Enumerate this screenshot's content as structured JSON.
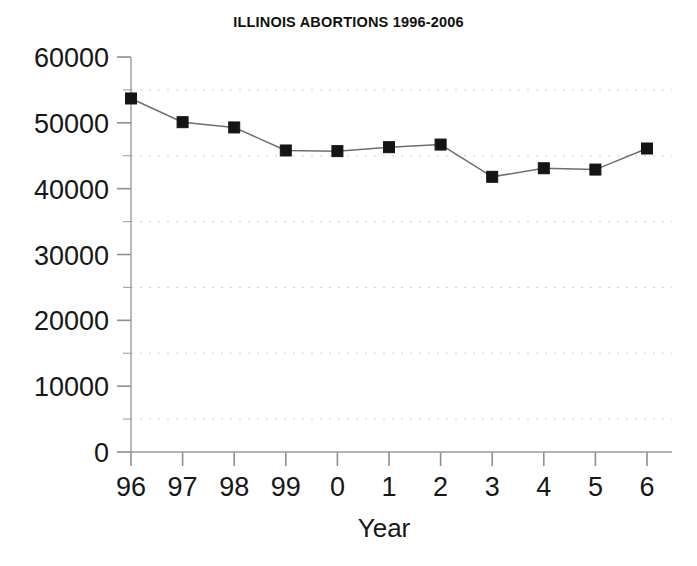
{
  "chart_data": {
    "type": "line",
    "title": "ILLINOIS ABORTIONS 1996-2006",
    "xlabel": "Year",
    "ylabel": "",
    "categories": [
      "96",
      "97",
      "98",
      "99",
      "0",
      "1",
      "2",
      "3",
      "4",
      "5",
      "6"
    ],
    "values": [
      53700,
      50100,
      49300,
      45800,
      45700,
      46300,
      46700,
      41800,
      43100,
      42900,
      46100
    ],
    "ylim": [
      0,
      60000
    ],
    "ytick_labels": [
      "0",
      "10000",
      "20000",
      "30000",
      "40000",
      "50000",
      "60000"
    ],
    "ytick_values": [
      0,
      10000,
      20000,
      30000,
      40000,
      50000,
      60000
    ],
    "yminor_values": [
      5000,
      15000,
      25000,
      35000,
      45000,
      55000
    ],
    "gridlines": "horizontal-dotted-at-minor-ticks",
    "grid": true,
    "legend": "none",
    "marker": "square",
    "marker_color": "#141414",
    "line_color": "#6e6e6e"
  },
  "axes": {
    "y_axis_name": "Abortions",
    "x_axis_name": "Year"
  }
}
